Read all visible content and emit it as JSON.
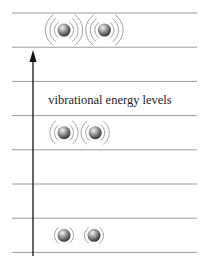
{
  "diagram": {
    "label": "vibrational energy levels",
    "level_count": 8,
    "axis": {
      "direction": "up",
      "meaning": "increasing energy"
    },
    "molecules": [
      {
        "name": "high-energy-pair",
        "level_index": 0,
        "vibration_arcs": 3
      },
      {
        "name": "mid-energy-pair",
        "level_index": 3,
        "vibration_arcs": 2
      },
      {
        "name": "ground-state-pair",
        "level_index": 6,
        "vibration_arcs": 1
      }
    ],
    "colors": {
      "line": "#9a9a9a",
      "arrow": "#111111",
      "arc": "#8a8a8a",
      "ball_light": "#f2f2f2",
      "ball_dark": "#333333"
    }
  }
}
